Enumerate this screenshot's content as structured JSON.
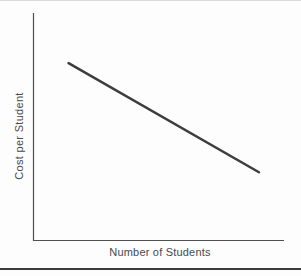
{
  "colors": {
    "axis": "#4f4f4f",
    "curve": "#3d3d3d",
    "label": "#4a4a4a",
    "top_edge": "#d9d9d9",
    "bottom_rule": "#3c3c3c",
    "background": "#fdfdfd"
  },
  "chart_data": {
    "type": "line",
    "title": "",
    "xlabel": "Number of Students",
    "ylabel": "Cost per Student",
    "x_range": [
      0,
      1
    ],
    "y_range": [
      0,
      1
    ],
    "grid": false,
    "legend": false,
    "axis_ticks": "none",
    "series": [
      {
        "name": "cost-per-student",
        "points": [
          [
            0.14,
            0.78
          ],
          [
            0.9,
            0.3
          ]
        ],
        "color": "#3d3d3d",
        "width": 2.5
      }
    ]
  }
}
